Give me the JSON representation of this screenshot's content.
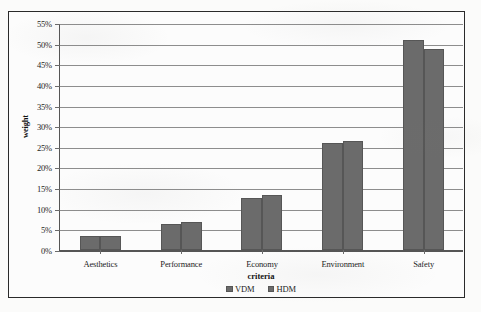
{
  "chart_data": {
    "type": "bar",
    "title": "",
    "xlabel": "criteria",
    "ylabel": "weight",
    "categories": [
      "Aesthetics",
      "Performance",
      "Economy",
      "Environment",
      "Safety"
    ],
    "series": [
      {
        "name": "VDM",
        "values": [
          3.3,
          6.2,
          12.5,
          26.0,
          51.0
        ]
      },
      {
        "name": "HDM",
        "values": [
          3.3,
          6.8,
          13.3,
          26.3,
          48.8
        ]
      }
    ],
    "ylim": [
      0,
      55
    ],
    "ytick_step": 5,
    "ytick_labels": [
      "0%",
      "5%",
      "10%",
      "15%",
      "20%",
      "25%",
      "30%",
      "35%",
      "40%",
      "45%",
      "50%",
      "55%"
    ],
    "grid": "horizontal",
    "legend_position": "bottom",
    "value_format": "percent",
    "bar_color": "#6b6b6b",
    "gridline_color": "#8d8d8d",
    "axis_color": "#555555",
    "frame_color": "#2a2a2a",
    "background_color": "#fbfbfa"
  }
}
